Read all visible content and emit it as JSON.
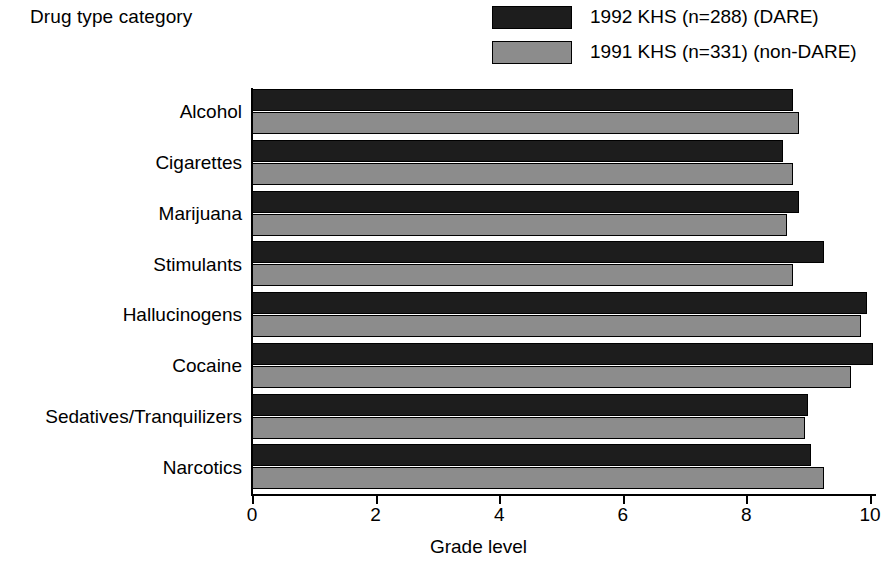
{
  "chart_data": {
    "type": "bar",
    "orientation": "horizontal",
    "title": "",
    "xlabel": "Grade level",
    "ylabel": "Drug type category",
    "xlim": [
      0,
      10
    ],
    "xticks": [
      0,
      2,
      4,
      6,
      8,
      10
    ],
    "grid": false,
    "legend_position": "top-right",
    "categories": [
      "Alcohol",
      "Cigarettes",
      "Marijuana",
      "Stimulants",
      "Hallucinogens",
      "Cocaine",
      "Sedatives/Tranquilizers",
      "Narcotics"
    ],
    "series": [
      {
        "name": "1992 KHS (n=288) (DARE)",
        "color": "#1d1d1d",
        "values": [
          8.75,
          8.6,
          8.85,
          9.25,
          9.95,
          10.05,
          9.0,
          9.05
        ]
      },
      {
        "name": "1991 KHS (n=331) (non-DARE)",
        "color": "#8c8c8c",
        "values": [
          8.85,
          8.75,
          8.65,
          8.75,
          9.85,
          9.7,
          8.95,
          9.25
        ]
      }
    ]
  },
  "axis": {
    "y_title": "Drug type category",
    "x_title": "Grade level",
    "x_tick_labels": [
      "0",
      "2",
      "4",
      "6",
      "8",
      "10"
    ]
  },
  "legend": {
    "items": [
      {
        "label": "1992 KHS (n=288) (DARE)",
        "swatch": "dark"
      },
      {
        "label": "1991 KHS (n=331) (non-DARE)",
        "swatch": "grey"
      }
    ]
  }
}
